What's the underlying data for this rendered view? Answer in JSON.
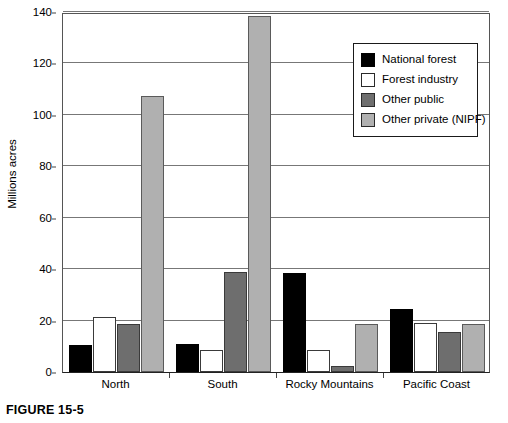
{
  "caption": "FIGURE 15-5",
  "chart_data": {
    "type": "bar",
    "title": "",
    "subtitle": "",
    "xlabel": "",
    "ylabel": "Millions acres",
    "ylim": [
      0,
      140
    ],
    "yticks": [
      0,
      20,
      40,
      60,
      80,
      100,
      120,
      140
    ],
    "ytick_labels": [
      "0",
      "20",
      "40",
      "60",
      "80",
      "100",
      "120",
      "140"
    ],
    "grid": true,
    "legend_position": "upper-right",
    "categories": [
      "North",
      "South",
      "Rocky Mountains",
      "Pacific Coast"
    ],
    "series": [
      {
        "name": "National forest",
        "color": "#000000",
        "values": [
          10.5,
          11.0,
          38.5,
          24.5
        ]
      },
      {
        "name": "Forest industry",
        "color": "#ffffff",
        "values": [
          21.5,
          8.5,
          8.5,
          19.0
        ]
      },
      {
        "name": "Other public",
        "color": "#6e6e6e",
        "values": [
          18.5,
          39.0,
          2.5,
          15.5
        ]
      },
      {
        "name": "Other private (NIPF)",
        "color": "#b0b0b0",
        "values": [
          107.5,
          138.5,
          18.5,
          18.5
        ]
      }
    ]
  }
}
